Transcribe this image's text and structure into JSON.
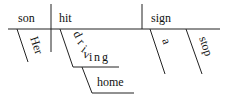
{
  "diagram": {
    "type": "sentence-diagram",
    "sentence_words": [
      "Her",
      "son",
      "hit",
      "driving",
      "home",
      "a",
      "stop",
      "sign"
    ],
    "baseline": {
      "subject": "son",
      "verb": "hit",
      "direct_object": "sign"
    },
    "modifiers": {
      "subject_modifier": "Her",
      "verb_modifier_gerund": "driving",
      "gerund_modifier": "home",
      "object_modifier_1": "a",
      "object_modifier_2": "stop"
    },
    "driving_letters": [
      "d",
      "r",
      "i",
      "v",
      "i",
      "n",
      "g"
    ]
  }
}
